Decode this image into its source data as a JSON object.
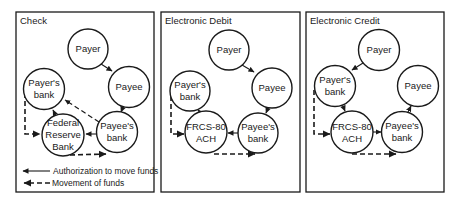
{
  "colors": {
    "ink": "#1a1a1a",
    "background": "#ffffff"
  },
  "panels": [
    {
      "title": "Check",
      "nodes": {
        "payer": {
          "lines": [
            "Payer"
          ]
        },
        "payee": {
          "lines": [
            "Payee"
          ]
        },
        "payers_bank": {
          "lines": [
            "Payer's",
            "bank"
          ]
        },
        "clearing": {
          "lines": [
            "Federal",
            "Reserve",
            "Bank"
          ]
        },
        "payees_bank": {
          "lines": [
            "Payee's",
            "bank"
          ]
        }
      },
      "authorization_flow": [
        "Payer → Payee",
        "Payee → Payee's bank",
        "Payee's bank → Federal Reserve Bank",
        "Payee's bank → Payer's bank",
        "Federal Reserve Bank → Payer's bank"
      ],
      "funds_flow": [
        "Payer's bank → Federal Reserve Bank",
        "Federal Reserve Bank → Payee's bank"
      ]
    },
    {
      "title": "Electronic Debit",
      "nodes": {
        "payer": {
          "lines": [
            "Payer"
          ]
        },
        "payee": {
          "lines": [
            "Payee"
          ]
        },
        "payers_bank": {
          "lines": [
            "Payer's",
            "bank"
          ]
        },
        "clearing": {
          "lines": [
            "FRCS-80",
            "ACH"
          ]
        },
        "payees_bank": {
          "lines": [
            "Payee's",
            "bank"
          ]
        }
      },
      "authorization_flow": [
        "Payer → Payee",
        "Payee → Payee's bank",
        "Payee's bank → FRCS-80 ACH",
        "FRCS-80 ACH → Payer's bank"
      ],
      "funds_flow": [
        "Payer's bank → FRCS-80 ACH",
        "FRCS-80 ACH → Payee's bank"
      ]
    },
    {
      "title": "Electronic Credit",
      "nodes": {
        "payer": {
          "lines": [
            "Payer"
          ]
        },
        "payee": {
          "lines": [
            "Payee"
          ]
        },
        "payers_bank": {
          "lines": [
            "Payer's",
            "bank"
          ]
        },
        "clearing": {
          "lines": [
            "FRCS-80",
            "ACH"
          ]
        },
        "payees_bank": {
          "lines": [
            "Payee's",
            "bank"
          ]
        }
      },
      "authorization_flow": [
        "Payer → Payer's bank",
        "Payer's bank → FRCS-80 ACH",
        "FRCS-80 ACH → Payee's bank",
        "Payee's bank → Payee"
      ],
      "funds_flow": [
        "Payer's bank → FRCS-80 ACH",
        "FRCS-80 ACH → Payee's bank"
      ]
    }
  ],
  "legend": {
    "authorization": "Authorization to move funds",
    "funds": "Movement of funds"
  }
}
